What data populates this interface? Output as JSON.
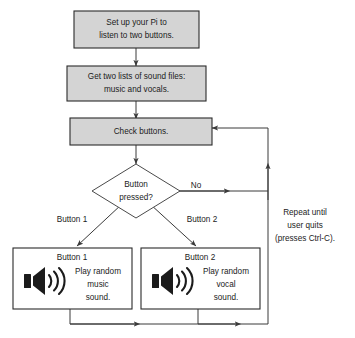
{
  "diagram": {
    "colors": {
      "process_fill": "#d4d4d4",
      "plain_fill": "#ffffff",
      "stroke": "#2b2b2b",
      "background": "#ffffff",
      "text": "#1b1b1b"
    },
    "nodes": {
      "setup": {
        "type": "process",
        "line1": "Set up your Pi to",
        "line2": "listen to two buttons."
      },
      "lists": {
        "type": "process",
        "line1": "Get two lists of sound files:",
        "line2": "music and vocals."
      },
      "check": {
        "type": "process",
        "line1": "Check buttons."
      },
      "decision": {
        "type": "decision",
        "line1": "Button",
        "line2": "pressed?"
      },
      "action_left": {
        "type": "action",
        "heading": "Button 1",
        "line1": "Play random",
        "line2": "music",
        "line3": "sound.",
        "icon": "speaker-icon"
      },
      "action_right": {
        "type": "action",
        "heading": "Button 2",
        "line1": "Play random",
        "line2": "vocal",
        "line3": "sound.",
        "icon": "speaker-icon"
      }
    },
    "edge_labels": {
      "no": "No",
      "button1": "Button 1",
      "button2": "Button 2"
    },
    "note": {
      "line1": "Repeat until",
      "line2": "user quits",
      "line3": "(presses Ctrl-C)."
    }
  }
}
